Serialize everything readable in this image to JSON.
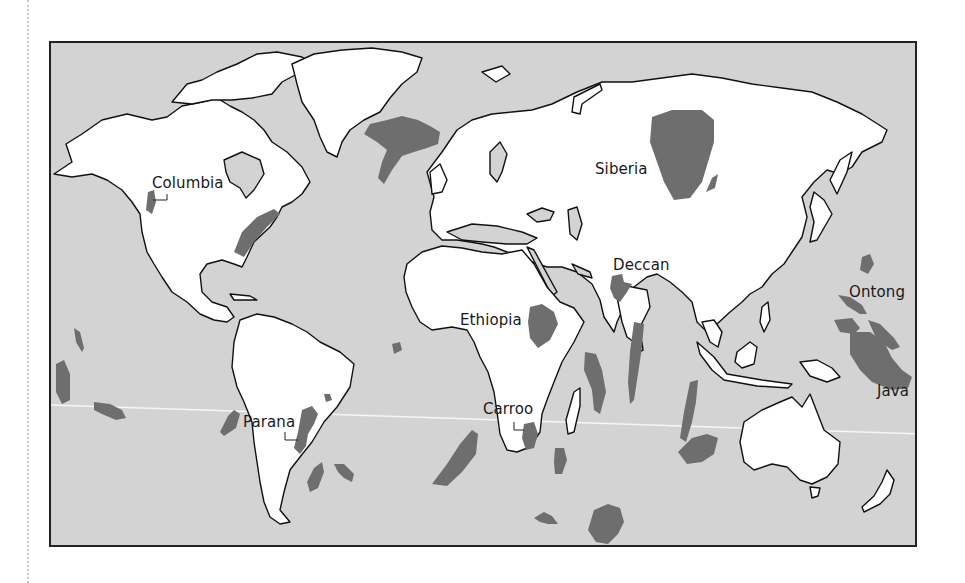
{
  "map": {
    "title": "Large igneous provinces (flood basalts) of the world",
    "colors": {
      "ocean": "#d3d3d3",
      "land": "#ffffff",
      "coastline": "#111111",
      "province": "#6e6e6e",
      "tropic_line": "#f4f4f4",
      "frame": "#222222"
    },
    "labels": [
      {
        "id": "columbia",
        "text": "Columbia"
      },
      {
        "id": "siberia",
        "text": "Siberia"
      },
      {
        "id": "deccan",
        "text": "Deccan"
      },
      {
        "id": "ethiopia",
        "text": "Ethiopia"
      },
      {
        "id": "ontong",
        "text": "Ontong"
      },
      {
        "id": "java",
        "text": "Java"
      },
      {
        "id": "parana",
        "text": "Parana"
      },
      {
        "id": "carroo",
        "text": "Carroo"
      }
    ]
  }
}
